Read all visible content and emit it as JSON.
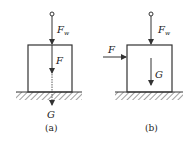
{
  "figure": {
    "panels": [
      {
        "id": "a",
        "caption": "(a)",
        "labels": {
          "force_top": "F",
          "force_top_sub": "w",
          "force_inner": "F",
          "weight": "G"
        }
      },
      {
        "id": "b",
        "caption": "(b)",
        "labels": {
          "force_top": "F",
          "force_top_sub": "w",
          "force_side": "F",
          "weight": "G"
        }
      }
    ],
    "colors": {
      "stroke": "#333333",
      "text": "#222222",
      "background": "#ffffff"
    }
  }
}
